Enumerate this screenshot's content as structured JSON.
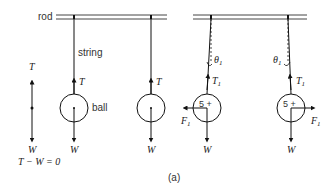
{
  "diagram": {
    "caption": "(a)",
    "labels": {
      "rod": "rod",
      "string": "string",
      "ball": "ball"
    },
    "free_body": {
      "top_force": "T",
      "bottom_force": "W",
      "equation": "T − W = 0"
    },
    "panels": [
      {
        "name": "hanging-ball-1",
        "up_force": "T",
        "down_force": "W"
      },
      {
        "name": "hanging-ball-2",
        "up_force": "T",
        "down_force": "W"
      },
      {
        "name": "deflected-ball-left",
        "up_force": "T",
        "up_sub": "1",
        "angle": "θ",
        "angle_sub": "1",
        "side_force": "F",
        "side_sub": "1",
        "down_force": "W",
        "ball_mark": "5 +"
      },
      {
        "name": "deflected-ball-right",
        "up_force": "T",
        "up_sub": "1",
        "angle": "θ",
        "angle_sub": "1",
        "side_force": "F",
        "side_sub": "1",
        "down_force": "W",
        "ball_mark": "5 +"
      }
    ]
  }
}
